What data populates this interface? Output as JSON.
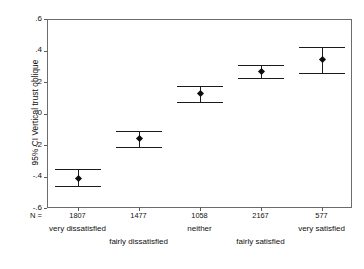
{
  "chart_data": {
    "type": "scatter",
    "title": "",
    "subtitle": "",
    "xlabel": "",
    "ylabel": "95% CI Vertical trust oblique",
    "ylim": [
      -0.6,
      0.6
    ],
    "y_ticks": [
      ".6",
      ".4",
      ".2",
      "-.0",
      "-.2",
      "-.4",
      "-.6"
    ],
    "y_tick_values": [
      0.6,
      0.4,
      0.2,
      0.0,
      -0.2,
      -0.4,
      -0.6
    ],
    "grid": false,
    "legend": "none",
    "n_label": "N =",
    "categories": [
      "very dissatisfied",
      "fairly dissatisfied",
      "neither",
      "fairly satisfied",
      "very satisfied"
    ],
    "n_values": [
      "1807",
      "1477",
      "1058",
      "2167",
      "577"
    ],
    "series": [
      {
        "name": "95% CI Vertical trust oblique",
        "means": [
          -0.41,
          -0.16,
          0.125,
          0.265,
          0.345
        ],
        "ci_lower": [
          -0.46,
          -0.21,
          0.07,
          0.225,
          0.26
        ],
        "ci_upper": [
          -0.355,
          -0.11,
          0.175,
          0.305,
          0.425
        ]
      }
    ]
  },
  "style": {
    "marker_color": "#0d0d0d",
    "bar_color": "#1b1b1b",
    "frame_color": "#6b6b6b",
    "background": "#ffffff"
  }
}
